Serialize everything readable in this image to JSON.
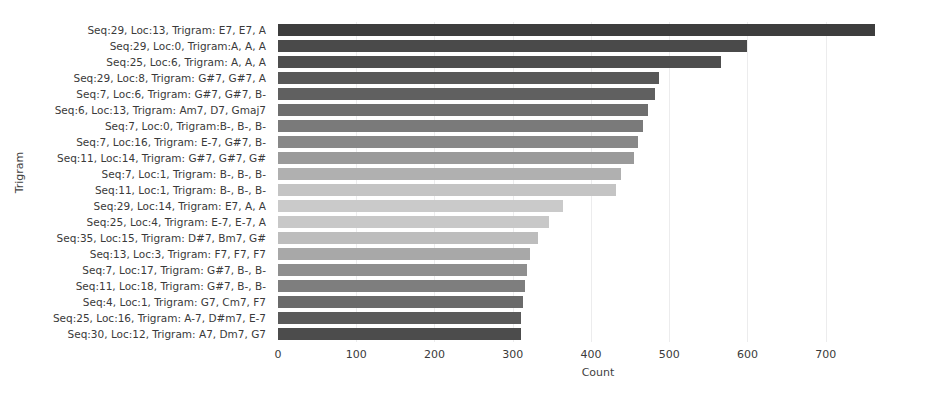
{
  "chart_data": {
    "type": "bar",
    "orientation": "horizontal",
    "title": "",
    "xlabel": "Count",
    "ylabel": "Trigram",
    "xlim": [
      0,
      818
    ],
    "xticks": [
      0,
      100,
      200,
      300,
      400,
      500,
      600,
      700
    ],
    "grid": true,
    "legend": false,
    "categories": [
      "Seq:29, Loc:13, Trigram: E7,  E7,  A",
      "Seq:29, Loc:0, Trigram:A,  A,  A",
      "Seq:25, Loc:6, Trigram: A,  A,  A",
      "Seq:29, Loc:8, Trigram: G#7,  G#7,  A",
      "Seq:7, Loc:6, Trigram: G#7,  G#7,  B-",
      "Seq:6, Loc:13, Trigram: Am7,  D7,  Gmaj7",
      "Seq:7, Loc:0, Trigram:B-,  B-,  B-",
      "Seq:7, Loc:16, Trigram: E-7,  G#7,  B-",
      "Seq:11, Loc:14, Trigram: G#7,  G#7,  G#",
      "Seq:7, Loc:1, Trigram: B-,  B-,  B-",
      "Seq:11, Loc:1, Trigram: B-,  B-,  B-",
      "Seq:29, Loc:14, Trigram: E7,  A,  A",
      "Seq:25, Loc:4, Trigram: E-7,  E-7,  A",
      "Seq:35, Loc:15, Trigram: D#7,  Bm7,  G#",
      "Seq:13, Loc:3, Trigram: F7,  F7,  F7",
      "Seq:7, Loc:17, Trigram: G#7,  B-,  B-",
      "Seq:11, Loc:18, Trigram: G#7,  B-,  B-",
      "Seq:4, Loc:1, Trigram: G7,  Cm7,  F7",
      "Seq:25, Loc:16, Trigram: A-7,  D#m7,  E-7",
      "Seq:30, Loc:12, Trigram: A7,  Dm7,  G7"
    ],
    "values": [
      763,
      599,
      566,
      487,
      482,
      473,
      466,
      460,
      455,
      438,
      432,
      364,
      346,
      332,
      322,
      318,
      316,
      313,
      311,
      310
    ],
    "bar_colors": [
      "#3d3d3d",
      "#4a4a4a",
      "#4e4e4e",
      "#585858",
      "#606060",
      "#6e6e6e",
      "#7a7a7a",
      "#888888",
      "#9a9a9a",
      "#b0b0b0",
      "#c4c4c4",
      "#cacaca",
      "#c8c8c8",
      "#bdbdbd",
      "#a8a8a8",
      "#8f8f8f",
      "#7e7e7e",
      "#6a6a6a",
      "#5a5a5a",
      "#4c4c4c"
    ]
  },
  "axes": {
    "y_title": "Trigram",
    "x_title": "Count",
    "x_tick_labels": [
      "0",
      "100",
      "200",
      "300",
      "400",
      "500",
      "600",
      "700"
    ]
  },
  "style": {
    "grid_color": "#ececed",
    "background": "#ffffff",
    "text_color": "#3a3a3a"
  }
}
